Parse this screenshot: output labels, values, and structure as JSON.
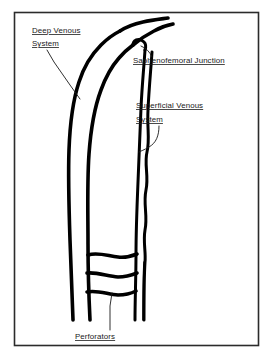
{
  "figure": {
    "frame": {
      "stroke_color": "#2b2b2b",
      "background_color": "#ffffff"
    },
    "line_color": "#000000",
    "labels": {
      "deep_venous_system": {
        "line1": "Deep Venous",
        "line2": "System"
      },
      "saphenofemoral_junction": {
        "line1": "Saphenofemoral Junction"
      },
      "superficial_venous_system": {
        "line1": "Superficial Venous",
        "line2": "System"
      },
      "perforators": {
        "line1": "Perforators"
      }
    }
  }
}
